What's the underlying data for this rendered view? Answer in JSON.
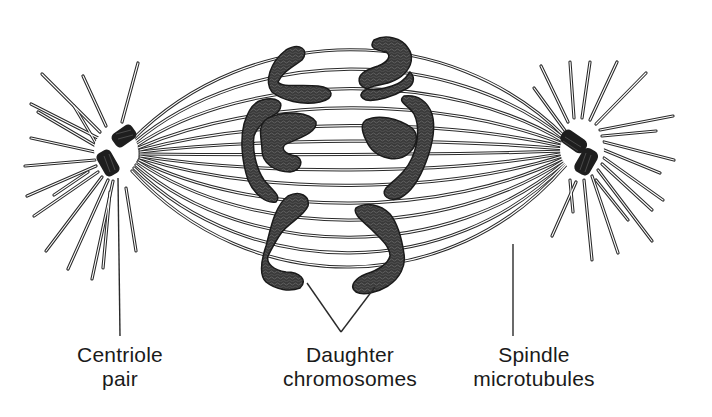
{
  "figure": {
    "colors": {
      "background": "#ffffff",
      "line": "#2a2a2a",
      "chromosome_fill": "#3c3c3c",
      "centriole_fill": "#1e1e1e",
      "label_text": "#1a1a1a"
    }
  },
  "labels": {
    "centriole": {
      "line1": "Centriole",
      "line2": "pair"
    },
    "daughter": {
      "line1": "Daughter",
      "line2": "chromosomes"
    },
    "spindle": {
      "line1": "Spindle",
      "line2": "microtubules"
    }
  },
  "structures": {
    "left_pole": {
      "name": "centriole-pair-left",
      "cx": 116,
      "cy": 152
    },
    "right_pole": {
      "name": "centriole-pair-right",
      "cx": 582,
      "cy": 150
    },
    "chromosome_sets": [
      "left-daughter-set",
      "right-daughter-set"
    ]
  }
}
